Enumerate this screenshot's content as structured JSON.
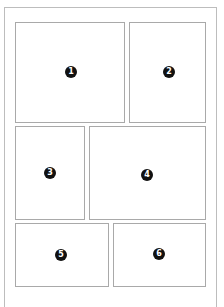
{
  "layout": {
    "description": "Comic page panel layout with six numbered panels",
    "panels": [
      {
        "number": "1",
        "left": 15,
        "top": 22,
        "width": 110,
        "height": 101,
        "badge_x": 55,
        "badge_y": 49
      },
      {
        "number": "2",
        "left": 129,
        "top": 22,
        "width": 77,
        "height": 101,
        "badge_x": 39,
        "badge_y": 49
      },
      {
        "number": "3",
        "left": 15,
        "top": 126,
        "width": 70,
        "height": 94,
        "badge_x": 34,
        "badge_y": 46
      },
      {
        "number": "4",
        "left": 89,
        "top": 126,
        "width": 117,
        "height": 94,
        "badge_x": 57,
        "badge_y": 48
      },
      {
        "number": "5",
        "left": 15,
        "top": 223,
        "width": 94,
        "height": 64,
        "badge_x": 45,
        "badge_y": 31
      },
      {
        "number": "6",
        "left": 113,
        "top": 223,
        "width": 93,
        "height": 64,
        "badge_x": 45,
        "badge_y": 30
      }
    ]
  },
  "colors": {
    "panel_border": "#a9a9a9",
    "page_border": "#bdbdbd",
    "badge_fill": "#111111",
    "badge_text": "#ffffff"
  }
}
